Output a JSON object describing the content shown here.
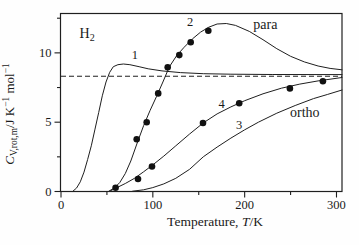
{
  "figure": {
    "ink_color": "#1f1f1f",
    "background": "#fefefe",
    "dot_color": "#111111"
  },
  "chart_data": {
    "type": "line",
    "title": "",
    "compound_label": {
      "segments": [
        {
          "t": "H"
        },
        {
          "t": "2",
          "style": "sub"
        }
      ],
      "T": 28.5,
      "C": 11.4
    },
    "xlabel_segments": [
      {
        "t": "Temperature, "
      },
      {
        "t": "T",
        "style": "italic"
      },
      {
        "t": "/K"
      }
    ],
    "ylabel_segments": [
      {
        "t": "C",
        "style": "italic"
      },
      {
        "t": "V,rot,m",
        "style": "sub"
      },
      {
        "t": "/J K"
      },
      {
        "t": "−1",
        "style": "sup"
      },
      {
        "t": " mol"
      },
      {
        "t": "−1",
        "style": "sup"
      }
    ],
    "xlim": [
      0,
      306
    ],
    "ylim": [
      0,
      12.84
    ],
    "x_major_ticks": [
      {
        "v": 0,
        "label": "0"
      },
      {
        "v": 100,
        "label": "100"
      },
      {
        "v": 200,
        "label": "200"
      },
      {
        "v": 300,
        "label": "300"
      }
    ],
    "x_minor_ticks": [
      50,
      150,
      250
    ],
    "y_major_ticks": [
      {
        "v": 0,
        "label": "0"
      },
      {
        "v": 5,
        "label": "5"
      },
      {
        "v": 10,
        "label": "10"
      }
    ],
    "y_minor_ticks": [
      2.5,
      7.5,
      12.5
    ],
    "grid": false,
    "legend": "none",
    "reference_line": {
      "value": 8.314,
      "style": "dashed"
    },
    "series": [
      {
        "name": "curve-1",
        "kind": "line",
        "points": [
          [
            13,
            0.02
          ],
          [
            17,
            0.25
          ],
          [
            21,
            0.7
          ],
          [
            25,
            1.4
          ],
          [
            29,
            2.3
          ],
          [
            33,
            3.3
          ],
          [
            37,
            4.5
          ],
          [
            41,
            5.7
          ],
          [
            45,
            6.9
          ],
          [
            49,
            7.9
          ],
          [
            53,
            8.6
          ],
          [
            57,
            9.0
          ],
          [
            62,
            9.15
          ],
          [
            68,
            9.2
          ],
          [
            75,
            9.15
          ],
          [
            85,
            9.0
          ],
          [
            95,
            8.85
          ],
          [
            110,
            8.7
          ],
          [
            130,
            8.58
          ],
          [
            155,
            8.5
          ],
          [
            185,
            8.46
          ],
          [
            230,
            8.44
          ],
          [
            306,
            8.43
          ]
        ]
      },
      {
        "name": "curve-2-para",
        "kind": "line",
        "points": [
          [
            52,
            0.02
          ],
          [
            58,
            0.25
          ],
          [
            64,
            0.65
          ],
          [
            70,
            1.3
          ],
          [
            76,
            2.2
          ],
          [
            83,
            3.5
          ],
          [
            90,
            4.75
          ],
          [
            97,
            5.85
          ],
          [
            104,
            6.85
          ],
          [
            111,
            7.9
          ],
          [
            118,
            9.0
          ],
          [
            126,
            9.8
          ],
          [
            134,
            10.4
          ],
          [
            143,
            11.0
          ],
          [
            152,
            11.5
          ],
          [
            161,
            11.85
          ],
          [
            170,
            12.08
          ],
          [
            180,
            12.12
          ],
          [
            190,
            11.98
          ],
          [
            205,
            11.55
          ],
          [
            220,
            10.95
          ],
          [
            235,
            10.3
          ],
          [
            250,
            9.75
          ],
          [
            265,
            9.35
          ],
          [
            280,
            9.05
          ],
          [
            293,
            8.88
          ],
          [
            306,
            8.78
          ]
        ]
      },
      {
        "name": "curve-3-ortho",
        "kind": "line",
        "points": [
          [
            78,
            0.02
          ],
          [
            90,
            0.12
          ],
          [
            100,
            0.28
          ],
          [
            112,
            0.55
          ],
          [
            125,
            0.95
          ],
          [
            140,
            1.6
          ],
          [
            155,
            2.5
          ],
          [
            170,
            3.2
          ],
          [
            185,
            3.85
          ],
          [
            200,
            4.45
          ],
          [
            215,
            5.0
          ],
          [
            235,
            5.65
          ],
          [
            255,
            6.2
          ],
          [
            275,
            6.7
          ],
          [
            290,
            7.0
          ],
          [
            306,
            7.32
          ]
        ]
      },
      {
        "name": "curve-4-normal",
        "kind": "line",
        "points": [
          [
            53,
            0.02
          ],
          [
            60,
            0.25
          ],
          [
            70,
            0.58
          ],
          [
            80,
            0.95
          ],
          [
            90,
            1.42
          ],
          [
            100,
            1.92
          ],
          [
            112,
            2.55
          ],
          [
            125,
            3.3
          ],
          [
            140,
            4.15
          ],
          [
            155,
            4.95
          ],
          [
            170,
            5.6
          ],
          [
            185,
            6.1
          ],
          [
            200,
            6.55
          ],
          [
            220,
            7.05
          ],
          [
            240,
            7.45
          ],
          [
            260,
            7.75
          ],
          [
            280,
            7.98
          ],
          [
            306,
            8.22
          ]
        ]
      },
      {
        "name": "data-points-para",
        "kind": "scatter",
        "points": [
          [
            82.4,
            3.77
          ],
          [
            93.3,
            4.99
          ],
          [
            105.9,
            7.08
          ],
          [
            116.2,
            8.96
          ],
          [
            128.8,
            9.84
          ],
          [
            141.2,
            10.76
          ],
          [
            160.4,
            11.6
          ]
        ]
      },
      {
        "name": "data-points-normal",
        "kind": "scatter",
        "points": [
          [
            59.5,
            0.27
          ],
          [
            83.8,
            0.9
          ],
          [
            99.1,
            1.8
          ],
          [
            154.6,
            4.94
          ],
          [
            194.1,
            6.36
          ],
          [
            249.3,
            7.44
          ],
          [
            285.2,
            7.96
          ]
        ]
      }
    ],
    "curve_labels": [
      {
        "text": "1",
        "T": 80.5,
        "C": 9.9,
        "size": 12.5
      },
      {
        "text": "2",
        "T": 140.5,
        "C": 12.22,
        "size": 12.5
      },
      {
        "text": "para",
        "T": 222.5,
        "C": 12.0,
        "size": 14
      },
      {
        "text": "4",
        "T": 175,
        "C": 6.36,
        "size": 12.5
      },
      {
        "text": "3",
        "T": 194,
        "C": 4.83,
        "size": 12.5
      },
      {
        "text": "ortho",
        "T": 265.5,
        "C": 5.7,
        "size": 14
      }
    ]
  }
}
